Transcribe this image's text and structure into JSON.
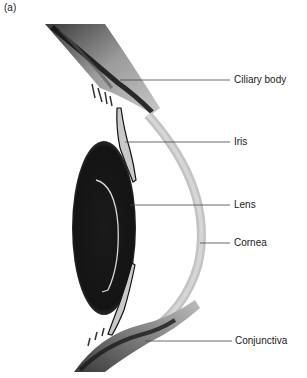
{
  "figure": {
    "panel_label": "(a)",
    "labels": [
      {
        "id": "ciliary-body",
        "text": "Ciliary body"
      },
      {
        "id": "iris",
        "text": "Iris"
      },
      {
        "id": "lens",
        "text": "Lens"
      },
      {
        "id": "cornea",
        "text": "Cornea"
      },
      {
        "id": "conjunctiva",
        "text": "Conjunctiva"
      }
    ]
  }
}
